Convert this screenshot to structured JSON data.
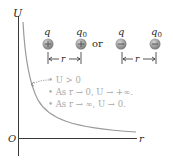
{
  "axes": {
    "y_label": "U",
    "x_label": "r",
    "origin_label": "O"
  },
  "charges": {
    "pair1": {
      "q_label": "q",
      "q0_label": "q",
      "q0_sub": "0",
      "q_sign": "+",
      "q0_sign": "+"
    },
    "connector": "or",
    "pair2": {
      "q_label": "q",
      "q0_label": "q",
      "q0_sub": "0",
      "q_sign": "−",
      "q0_sign": "−"
    },
    "separation_label": "r"
  },
  "notes": [
    "• U > 0",
    "• As r → 0, U → +∞.",
    "• As r → ∞, U → 0."
  ],
  "colors": {
    "axis": "#3a3a3a",
    "curve": "#9a9a9a",
    "note_text": "#a8a8a8",
    "charge_fill": "#8e8e8e",
    "charge_highlight": "#c9c9c9",
    "label": "#2b2b2b"
  }
}
